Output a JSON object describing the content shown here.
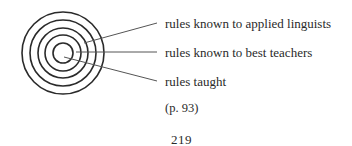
{
  "diagram": {
    "rings": 5,
    "labels": [
      {
        "text": "rules known to applied linguists"
      },
      {
        "text": "rules known to best teachers"
      },
      {
        "text": "rules taught"
      }
    ]
  },
  "citation": "(p. 93)",
  "page_number": "219",
  "colors": {
    "ink": "#2a2a2a",
    "leader_line": "#555555"
  }
}
